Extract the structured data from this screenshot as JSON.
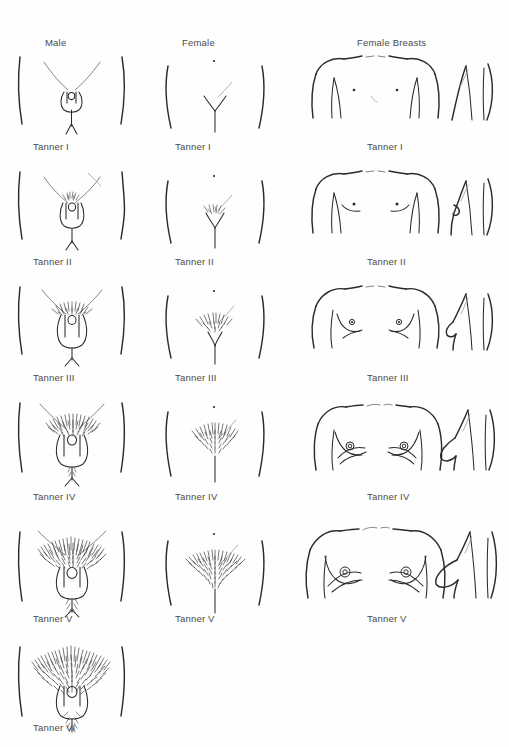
{
  "page": {
    "background_color": "#fefefe",
    "line_color": "#2b2b2d",
    "text_color": "#4a4a4c"
  },
  "columns": [
    {
      "id": "male",
      "label": "Male"
    },
    {
      "id": "female",
      "label": "Female"
    },
    {
      "id": "breasts",
      "label": "Female Breasts"
    }
  ],
  "rows": [
    {
      "index": 1,
      "male_label": "Tanner I",
      "female_label": "Tanner I",
      "breasts_label": "Tanner I"
    },
    {
      "index": 2,
      "male_label": "Tanner II",
      "female_label": "Tanner II",
      "breasts_label": "Tanner II"
    },
    {
      "index": 3,
      "male_label": "Tanner III",
      "female_label": "Tanner III",
      "breasts_label": "Tanner III"
    },
    {
      "index": 4,
      "male_label": "Tanner IV",
      "female_label": "Tanner IV",
      "breasts_label": "Tanner IV"
    },
    {
      "index": 5,
      "male_label": "Tanner V",
      "female_label": "Tanner V",
      "breasts_label": "Tanner V"
    },
    {
      "index": 6,
      "male_label": "Tanner VI",
      "female_label": "",
      "breasts_label": ""
    }
  ],
  "figures": {
    "male": "male-pubic-genital-diagram",
    "female": "female-pubic-diagram",
    "breasts_frontal": "female-breast-frontal-diagram",
    "breasts_lateral": "female-breast-lateral-diagram"
  }
}
